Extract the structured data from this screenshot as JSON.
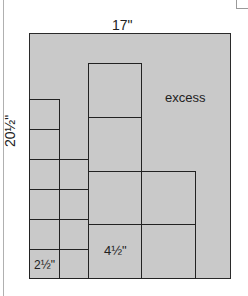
{
  "diagram": {
    "sheet": {
      "width_label": "17\"",
      "height_label": "20½\"",
      "fill_color": "#c9c9c9",
      "border_color": "#2a2a2a"
    },
    "regions": {
      "excess_label": "excess"
    },
    "pieces": {
      "small_square_label": "2½\"",
      "small_square_size_in": 2.5,
      "large_square_label": "4½\"",
      "large_square_size_in": 4.5
    },
    "layout": {
      "small_column_1_count": 6,
      "small_column_2_count": 4,
      "large_column_1_count": 4,
      "large_column_2_count": 2
    }
  }
}
